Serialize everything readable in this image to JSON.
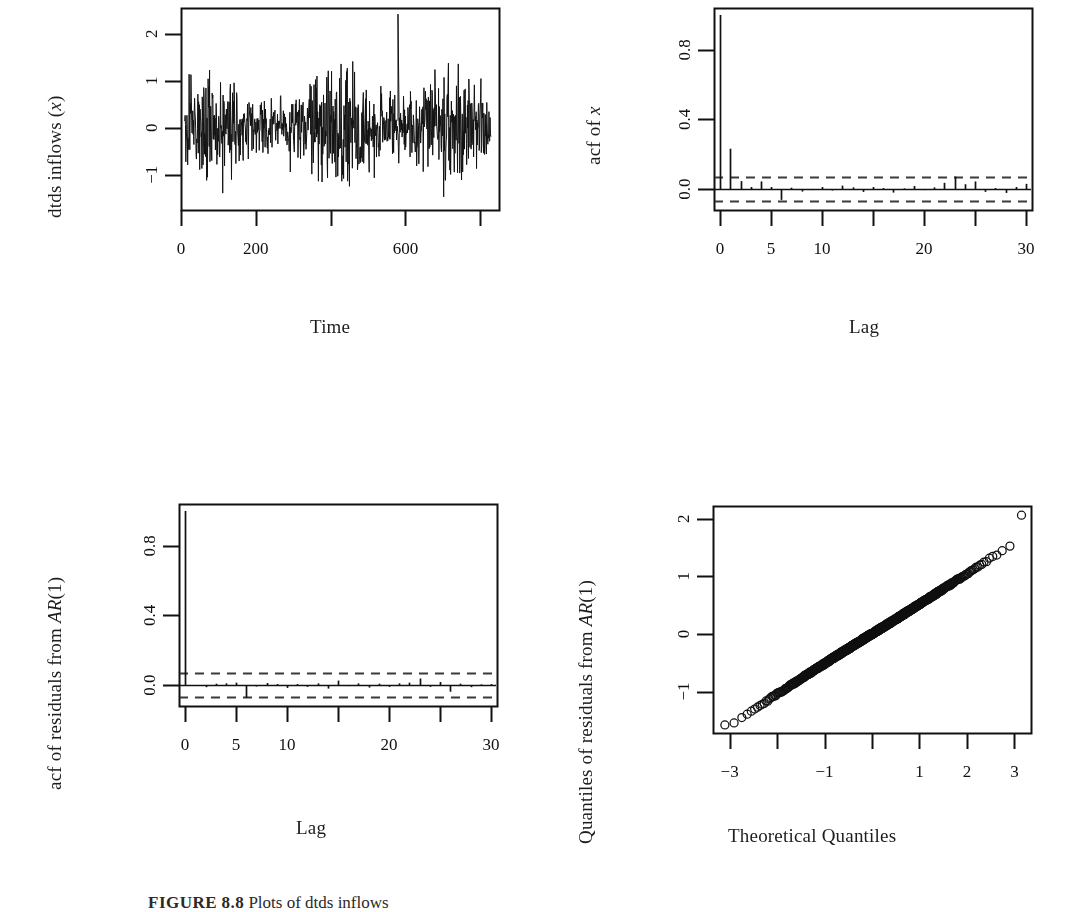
{
  "figure": {
    "caption_prefix": "FIGURE",
    "caption_number": "8.8",
    "caption_text": "Plots of dtds inflows"
  },
  "chart_data": [
    {
      "id": "timeseries",
      "type": "line",
      "title": "",
      "xlabel": "Time",
      "ylabel": "dtds inflows (x)",
      "ylabel_parts": [
        "dtds inflows (",
        "x",
        ")"
      ],
      "xlim": [
        0,
        850
      ],
      "ylim": [
        -1.75,
        2.55
      ],
      "xticks": [
        0,
        200,
        400,
        600,
        800
      ],
      "xtick_labels": [
        "0",
        "200",
        "",
        "600",
        ""
      ],
      "yticks": [
        -1,
        0,
        1,
        2
      ],
      "ytick_labels": [
        "-1",
        "0",
        "1",
        "2"
      ],
      "grid": false,
      "legend": "none",
      "n_points": 840,
      "series_mean": 0.0,
      "series_sd": 0.52,
      "outlier_x": 580,
      "outlier_y": 2.42,
      "seed": 17
    },
    {
      "id": "acf-x",
      "type": "bar",
      "title": "",
      "xlabel": "Lag",
      "ylabel": "acf of x",
      "ylabel_parts": [
        "acf of ",
        "x",
        ""
      ],
      "xlim": [
        -0.6,
        30.6
      ],
      "ylim": [
        -0.12,
        1.04
      ],
      "xticks": [
        0,
        5,
        10,
        15,
        20,
        25,
        30
      ],
      "xtick_labels": [
        "0",
        "5",
        "10",
        "",
        "20",
        "",
        "30"
      ],
      "yticks": [
        0.0,
        0.4,
        0.8
      ],
      "ytick_labels": [
        "0.0",
        "0.4",
        "0.8"
      ],
      "conf_level": 0.068,
      "grid": false,
      "legend": "none",
      "lags": [
        0,
        1,
        2,
        3,
        4,
        5,
        6,
        7,
        8,
        9,
        10,
        11,
        12,
        13,
        14,
        15,
        16,
        17,
        18,
        19,
        20,
        21,
        22,
        23,
        24,
        25,
        26,
        27,
        28,
        29,
        30
      ],
      "values": [
        1.0,
        0.232,
        0.046,
        0.012,
        0.044,
        0.012,
        -0.062,
        0.008,
        -0.014,
        -0.006,
        0.012,
        -0.008,
        0.02,
        0.01,
        -0.016,
        0.012,
        0.006,
        -0.02,
        0.004,
        0.018,
        -0.006,
        0.01,
        0.036,
        0.072,
        0.028,
        0.044,
        -0.016,
        0.006,
        -0.022,
        0.012,
        0.03
      ]
    },
    {
      "id": "acf-resid",
      "type": "bar",
      "title": "",
      "xlabel": "Lag",
      "ylabel": "acf of residuals from AR(1)",
      "ylabel_parts": [
        "acf of residuals from ",
        "AR",
        "(1)"
      ],
      "xlim": [
        -0.6,
        30.6
      ],
      "ylim": [
        -0.12,
        1.04
      ],
      "xticks": [
        0,
        5,
        10,
        15,
        20,
        25,
        30
      ],
      "xtick_labels": [
        "0",
        "5",
        "10",
        "",
        "20",
        "",
        "30"
      ],
      "yticks": [
        0.0,
        0.4,
        0.8
      ],
      "ytick_labels": [
        "0.0",
        "0.4",
        "0.8"
      ],
      "conf_level": 0.068,
      "grid": false,
      "legend": "none",
      "lags": [
        0,
        1,
        2,
        3,
        4,
        5,
        6,
        7,
        8,
        9,
        10,
        11,
        12,
        13,
        14,
        15,
        16,
        17,
        18,
        19,
        20,
        21,
        22,
        23,
        24,
        25,
        26,
        27,
        28,
        29,
        30
      ],
      "values": [
        1.0,
        -0.004,
        -0.012,
        0.008,
        0.01,
        0.014,
        -0.072,
        -0.008,
        0.012,
        0.006,
        -0.016,
        0.006,
        -0.01,
        0.01,
        -0.02,
        0.026,
        -0.006,
        0.01,
        -0.014,
        0.008,
        -0.01,
        0.01,
        0.014,
        0.038,
        -0.01,
        0.018,
        -0.038,
        0.008,
        -0.012,
        0.004,
        0.006
      ]
    },
    {
      "id": "qqplot",
      "type": "scatter",
      "title": "",
      "xlabel": "Theoretical Quantiles",
      "ylabel": "Quantiles of residuals from AR(1)",
      "ylabel_parts": [
        "Quantiles of residuals from ",
        "AR",
        "(1)"
      ],
      "xlim": [
        -3.35,
        3.35
      ],
      "ylim": [
        -1.72,
        2.22
      ],
      "xticks": [
        -3,
        -2,
        -1,
        0,
        1,
        2,
        3
      ],
      "xtick_labels": [
        "-3",
        "",
        "-1",
        "",
        "1",
        "2",
        "3"
      ],
      "yticks": [
        -1,
        0,
        1,
        2
      ],
      "ytick_labels": [
        "-1",
        "0",
        "1",
        "2"
      ],
      "grid": false,
      "legend": "none",
      "n_points": 820,
      "marker": "open-circle",
      "marker_radius": 4,
      "resid_sd": 0.5,
      "low_tail_x": -3.1,
      "low_tail_y": -1.58,
      "high_tail_x": 3.15,
      "high_tail_y": 2.06,
      "seed": 29
    }
  ]
}
